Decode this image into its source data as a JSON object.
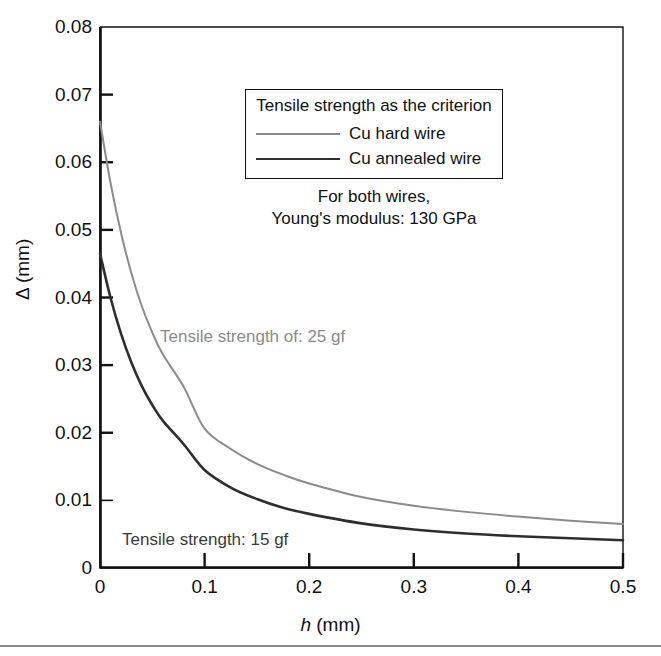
{
  "chart_data": {
    "type": "line",
    "title": "",
    "xlabel": "h (mm)",
    "ylabel": "Δ (mm)",
    "xlim": [
      0,
      0.5
    ],
    "ylim": [
      0,
      0.08
    ],
    "grid": false,
    "legend_position": "upper-right-inside",
    "x_ticks": [
      "0",
      "0.1",
      "0.2",
      "0.3",
      "0.4",
      "0.5"
    ],
    "x_tick_values": [
      0,
      0.1,
      0.2,
      0.3,
      0.4,
      0.5
    ],
    "y_ticks": [
      "0",
      "0.01",
      "0.02",
      "0.03",
      "0.04",
      "0.05",
      "0.06",
      "0.07",
      "0.08"
    ],
    "y_tick_values": [
      0,
      0.01,
      0.02,
      0.03,
      0.04,
      0.05,
      0.06,
      0.07,
      0.08
    ],
    "x": [
      0,
      0.01,
      0.02,
      0.03,
      0.04,
      0.05,
      0.06,
      0.08,
      0.1,
      0.125,
      0.15,
      0.175,
      0.2,
      0.25,
      0.3,
      0.35,
      0.4,
      0.45,
      0.5
    ],
    "series": [
      {
        "name": "Cu hard wire",
        "color": "#8b8b8b",
        "annotation": "Tensile strength of: 25 gf",
        "values": [
          0.066,
          0.057,
          0.0496,
          0.0436,
          0.0387,
          0.0348,
          0.0316,
          0.0268,
          0.0206,
          0.0176,
          0.0154,
          0.0138,
          0.0125,
          0.0105,
          0.0092,
          0.0083,
          0.0076,
          0.007,
          0.0065
        ]
      },
      {
        "name": "Cu annealed wire",
        "color": "#2e2e2e",
        "annotation": "Tensile strength: 15 gf",
        "values": [
          0.0465,
          0.04,
          0.0347,
          0.0304,
          0.0269,
          0.0241,
          0.0218,
          0.0183,
          0.0145,
          0.0119,
          0.0102,
          0.0089,
          0.008,
          0.0066,
          0.0057,
          0.0051,
          0.0047,
          0.0044,
          0.0041
        ]
      }
    ]
  },
  "legend": {
    "title": "Tensile strength as the criterion",
    "items": [
      {
        "label": "Cu hard wire",
        "color": "#8b8b8b"
      },
      {
        "label": "Cu annealed wire",
        "color": "#2e2e2e"
      }
    ],
    "note_line1": "For both wires,",
    "note_line2": "Young's modulus: 130 GPa"
  },
  "annotations": {
    "hard": "Tensile strength of: 25 gf",
    "annealed": "Tensile strength: 15 gf"
  },
  "axes": {
    "x_title_symbol": "h",
    "x_title_unit": " (mm)",
    "y_title": "Δ (mm)"
  },
  "colors": {
    "hard_wire": "#8b8b8b",
    "annealed_wire": "#2e2e2e",
    "axis": "#111111",
    "background": "#ffffff"
  }
}
